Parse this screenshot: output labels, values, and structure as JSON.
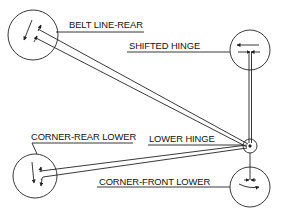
{
  "diagram": {
    "type": "door hinge check point diagram",
    "labels": {
      "belt_line_rear": "BELT LINE-REAR",
      "shifted_hinge": "SHIFTED HINGE",
      "corner_rear_lower": "CORNER-REAR LOWER",
      "lower_hinge": "LOWER HINGE",
      "corner_front_lower": "CORNER-FRONT LOWER"
    },
    "nodes": [
      {
        "id": "belt_line_rear",
        "label": "BELT LINE-REAR",
        "shape": "circle",
        "arrows": "diagonal down-left, with short arrows pointing up-right"
      },
      {
        "id": "shifted_hinge",
        "label": "SHIFTED HINGE",
        "shape": "circle",
        "arrows": "arrow pointing left; opposing arrows inward"
      },
      {
        "id": "lower_hinge",
        "label": "LOWER HINGE",
        "shape": "small circle",
        "arrows": "pivot point"
      },
      {
        "id": "corner_rear_lower",
        "label": "CORNER-REAR LOWER",
        "shape": "circle",
        "arrows": "arrows pointing down"
      },
      {
        "id": "corner_front_lower",
        "label": "CORNER-FRONT LOWER",
        "shape": "circle",
        "arrows": "opposing arrows inward; curved arrow pointing right"
      }
    ],
    "colors": {
      "line": "#222222",
      "background": "#ffffff"
    }
  }
}
